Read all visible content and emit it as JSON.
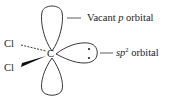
{
  "diagram": {
    "central_atom": "C",
    "substituents": [
      {
        "label": "Cl",
        "bond": "dashed"
      },
      {
        "label": "Cl",
        "bond": "wedge"
      }
    ],
    "labels": {
      "vacant_p_prefix": "Vacant ",
      "vacant_p_italic": "p",
      "vacant_p_suffix": " orbital",
      "sp2_italic": "sp",
      "sp2_sup": "2",
      "sp2_suffix": " orbital"
    },
    "lone_pair_electrons": 2
  }
}
